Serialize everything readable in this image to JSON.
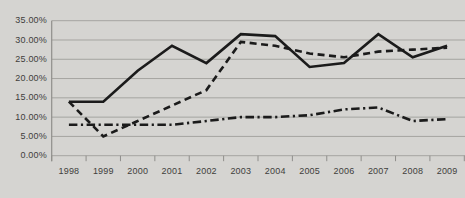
{
  "window": {
    "background_color": "#d5d4d1",
    "grid_color": "#a5a4a0",
    "axis_color": "#8f8e8b",
    "text_color": "#3f3e3c",
    "series_color": "#1b1b1b"
  },
  "chart_data": {
    "type": "line",
    "title": "",
    "xlabel": "",
    "ylabel": "",
    "grid": true,
    "legend": "none",
    "ylim": [
      0,
      35
    ],
    "ytick_step": 5,
    "ytick_labels": [
      "0.00%",
      "5.00%",
      "10.00%",
      "15.00%",
      "20.00%",
      "25.00%",
      "30.00%",
      "35.00%"
    ],
    "categories": [
      "1998",
      "1999",
      "2000",
      "2001",
      "2002",
      "2003",
      "2004",
      "2005",
      "2006",
      "2007",
      "2008",
      "2009"
    ],
    "series": [
      {
        "name": "series-1-solid",
        "style": "solid",
        "values": [
          14,
          14,
          22,
          28.5,
          24,
          31.5,
          31,
          23,
          24,
          31.5,
          25.5,
          28.5
        ]
      },
      {
        "name": "series-2-dashed",
        "style": "dashed",
        "values": [
          14,
          5,
          9,
          13,
          17,
          29.5,
          28.5,
          26.5,
          25.5,
          27,
          27.5,
          28
        ]
      },
      {
        "name": "series-3-dash-dot",
        "style": "dash-dot",
        "values": [
          8,
          8,
          8,
          8,
          9,
          10,
          10,
          10.5,
          12,
          12.5,
          9,
          9.5
        ]
      }
    ]
  }
}
